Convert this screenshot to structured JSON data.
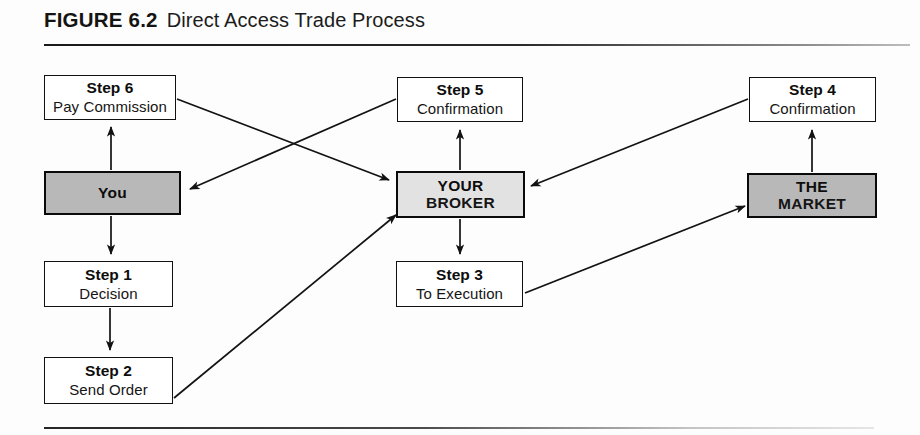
{
  "figure": {
    "label": "FIGURE 6.2",
    "title": "Direct Access Trade Process"
  },
  "colors": {
    "ink": "#111111",
    "shade_dark": "#b8b8b8",
    "shade_light": "#e2e2e2",
    "paper": "#ffffff"
  },
  "nodes": {
    "step6": {
      "line1": "Step 6",
      "line2": "Pay Commission",
      "kind": "step",
      "fill": "white"
    },
    "you": {
      "line1": "You",
      "line2": "",
      "kind": "actor",
      "fill": "shade-dark"
    },
    "step1": {
      "line1": "Step 1",
      "line2": "Decision",
      "kind": "step",
      "fill": "white"
    },
    "step2": {
      "line1": "Step 2",
      "line2": "Send Order",
      "kind": "step",
      "fill": "white"
    },
    "step5": {
      "line1": "Step 5",
      "line2": "Confirmation",
      "kind": "step",
      "fill": "white"
    },
    "broker": {
      "line1": "YOUR",
      "line2": "BROKER",
      "kind": "actor",
      "fill": "shade-light"
    },
    "step3": {
      "line1": "Step 3",
      "line2": "To Execution",
      "kind": "step",
      "fill": "white"
    },
    "step4": {
      "line1": "Step 4",
      "line2": "Confirmation",
      "kind": "step",
      "fill": "white"
    },
    "market": {
      "line1": "THE",
      "line2": "MARKET",
      "kind": "actor",
      "fill": "shade-dark"
    }
  },
  "edges": [
    {
      "id": "you-to-step6",
      "from": "you",
      "to": "step6",
      "label": ""
    },
    {
      "id": "step6-to-broker",
      "from": "step6",
      "to": "broker",
      "label": ""
    },
    {
      "id": "step5-to-you",
      "from": "step5",
      "to": "you",
      "label": ""
    },
    {
      "id": "you-to-step1",
      "from": "you",
      "to": "step1",
      "label": ""
    },
    {
      "id": "step1-to-step2",
      "from": "step1",
      "to": "step2",
      "label": ""
    },
    {
      "id": "step2-to-broker",
      "from": "step2",
      "to": "broker",
      "label": ""
    },
    {
      "id": "broker-to-step5",
      "from": "broker",
      "to": "step5",
      "label": ""
    },
    {
      "id": "broker-to-step3",
      "from": "broker",
      "to": "step3",
      "label": ""
    },
    {
      "id": "step3-to-market",
      "from": "step3",
      "to": "market",
      "label": ""
    },
    {
      "id": "market-to-step4",
      "from": "market",
      "to": "step4",
      "label": ""
    },
    {
      "id": "step4-to-broker",
      "from": "step4",
      "to": "broker",
      "label": ""
    }
  ]
}
